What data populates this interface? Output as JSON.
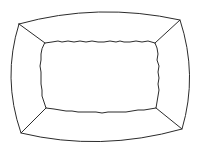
{
  "figure": {
    "stroke_color": "#2b2b2b",
    "background_color": "#ffffff",
    "shapes": {
      "outer_frame": "rounded-bulging-rectangle",
      "inner_panel": "irregular-wavy-rectangle",
      "corner_connectors": [
        "top-left",
        "top-right",
        "bottom-right",
        "bottom-left"
      ]
    }
  }
}
